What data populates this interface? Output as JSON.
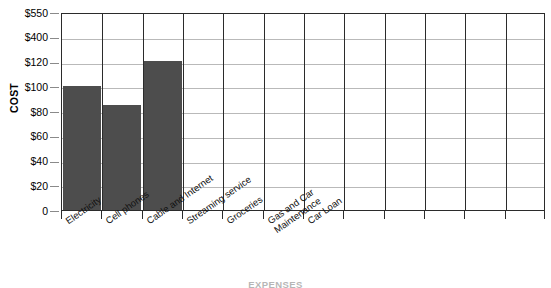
{
  "chart_data": {
    "type": "bar",
    "title": "",
    "xlabel": "EXPENSES",
    "ylabel": "COST",
    "categories": [
      "Electricity",
      "Cell phones",
      "Cable and Internet",
      "Streaming service",
      "Groceries",
      "Gas and Car\nMaintenance",
      "Car Loan"
    ],
    "values": [
      100,
      85,
      125,
      0,
      0,
      0,
      0
    ],
    "y_tick_labels": [
      "$550",
      "$400",
      "$120",
      "$100",
      "$80",
      "$60",
      "$40",
      "$20",
      "0"
    ],
    "y_tick_values": [
      550,
      400,
      120,
      100,
      80,
      60,
      40,
      20,
      0
    ],
    "y_axis_note": "tick labels are evenly spaced but not linearly scaled",
    "grid": {
      "horizontal": true,
      "vertical": true
    },
    "legend": null,
    "column_count": 12,
    "bar_color": "#4d4d4d",
    "gridline_color": "#b9b9b9",
    "axis_color": "#2b2b2b"
  },
  "axes": {
    "y_title": "COST",
    "x_title": "EXPENSES"
  }
}
